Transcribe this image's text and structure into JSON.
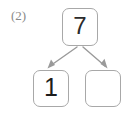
{
  "worksheet": {
    "item_number": "(2)",
    "diagram_type": "number-bond",
    "colors": {
      "box_border": "#a8a8a8",
      "arrow": "#9a9a9a",
      "digit": "#2b2b2b",
      "label": "#8a8a8a",
      "background": "#ffffff"
    },
    "boxes": {
      "top": {
        "name": "whole",
        "value": "7",
        "filled": true
      },
      "bottom_left": {
        "name": "part-one",
        "value": "1",
        "filled": true
      },
      "bottom_right": {
        "name": "part-two",
        "value": "",
        "filled": false
      }
    },
    "arrows": [
      {
        "name": "arrow-to-left-part",
        "from": "top",
        "to": "bottom_left",
        "direction": "down-left"
      },
      {
        "name": "arrow-to-right-part",
        "from": "top",
        "to": "bottom_right",
        "direction": "down-right"
      }
    ]
  }
}
